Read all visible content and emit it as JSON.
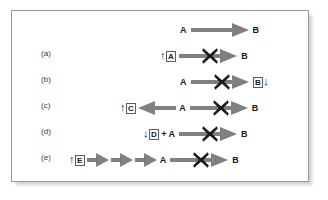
{
  "figure": {
    "background_color": "#ffffff",
    "border_color": "#9a9a9a",
    "arrow_color": "#808080",
    "block_color": "#1a1a1a",
    "box_border_color": "#5d5d5d"
  },
  "rows": [
    {
      "label": "",
      "kind": "reference",
      "reactant": "A",
      "product": "B",
      "blocked": false,
      "description": "A converts to B"
    },
    {
      "label": "(a)",
      "kind": "case",
      "reactant": "A",
      "product": "B",
      "reactant_boxed": true,
      "reactant_arrow": "up",
      "blocked": true,
      "description": "Increase of boxed A, reaction A to B blocked"
    },
    {
      "label": "(b)",
      "kind": "case",
      "reactant": "A",
      "product": "B",
      "product_boxed": true,
      "product_arrow": "down",
      "blocked": true,
      "description": "Decrease of boxed B, reaction A to B blocked"
    },
    {
      "label": "(c)",
      "kind": "case",
      "side_species": "C",
      "side_boxed": true,
      "side_arrow": "up",
      "side_direction": "left",
      "reactant": "A",
      "product": "B",
      "blocked": true,
      "description": "A diverted to boxed C which increases, reaction A to B blocked"
    },
    {
      "label": "(d)",
      "kind": "case",
      "side_species": "D",
      "side_boxed": true,
      "side_arrow": "down",
      "operator": "+",
      "reactant": "A",
      "product": "B",
      "blocked": true,
      "description": "Boxed D decreases and combines with A, reaction A to B blocked"
    },
    {
      "label": "(e)",
      "kind": "case",
      "side_species": "E",
      "side_boxed": true,
      "side_arrow": "up",
      "chain_arrows": 3,
      "reactant": "A",
      "product": "B",
      "blocked": true,
      "description": "Boxed E increases upstream through a chain of steps to A, reaction A to B blocked"
    }
  ],
  "glyphs": {
    "up_arrow": "↑",
    "down_arrow": "↓",
    "cross": "cross-icon",
    "right_arrow": "right-block-arrow-icon",
    "left_arrow": "left-block-arrow-icon"
  }
}
